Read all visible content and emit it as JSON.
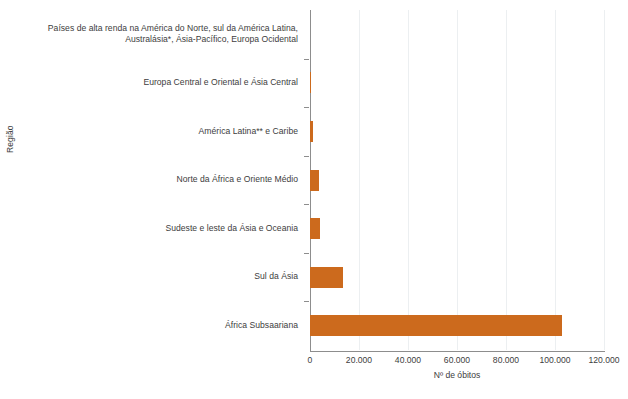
{
  "chart_data": {
    "type": "bar",
    "orientation": "horizontal",
    "title": "",
    "xlabel": "Nº de óbitos",
    "ylabel": "Região",
    "xlim": [
      0,
      120000
    ],
    "xticks": [
      0,
      20000,
      40000,
      60000,
      80000,
      100000,
      120000
    ],
    "xticklabels": [
      "0",
      "20.000",
      "40.000",
      "60.000",
      "80.000",
      "100.000",
      "120.000"
    ],
    "grid": true,
    "legend": false,
    "bar_color": "#cc6a1d",
    "categories": [
      "Países de alta renda na América do Norte, sul da América Latina, Australásia*, Ásia-Pacífico, Europa Ocidental",
      "Europa Central e Oriental e Ásia Central",
      "América Latina** e Caribe",
      "Norte da África e Oriente Médio",
      "Sudeste e leste da Ásia e Oceania",
      "Sul da Ásia",
      "África Subsaariana"
    ],
    "values": [
      100,
      200,
      1200,
      3700,
      4000,
      13500,
      102800
    ]
  },
  "axes": {
    "y_title": "Região",
    "x_title": "Nº de óbitos"
  },
  "footnote": ""
}
